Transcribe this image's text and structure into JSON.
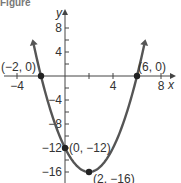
{
  "caption": "Figure",
  "chart_data": {
    "type": "line",
    "title": "",
    "xlabel": "x",
    "ylabel": "y",
    "xlim": [
      -5,
      9
    ],
    "ylim": [
      -17,
      12
    ],
    "x_ticks": [
      -4,
      -2,
      0,
      2,
      4,
      6,
      8
    ],
    "x_tick_labels": [
      {
        "value": -4,
        "label": "−4"
      },
      {
        "value": 4,
        "label": "4"
      },
      {
        "value": 8,
        "label": "8"
      }
    ],
    "y_ticks": [
      8,
      6,
      4,
      2,
      -2,
      -4,
      -6,
      -8,
      -10,
      -12,
      -14,
      -16
    ],
    "y_tick_labels": [
      {
        "value": 8,
        "label": "8"
      },
      {
        "value": 4,
        "label": "4"
      },
      {
        "value": -4,
        "label": "−4"
      },
      {
        "value": -8,
        "label": "−8"
      },
      {
        "value": -12,
        "label": "−12"
      },
      {
        "value": -16,
        "label": "−16"
      }
    ],
    "function": "y = x^2 - 4x - 12",
    "curve_x_range": [
      -2.6,
      6.6
    ],
    "grid": false,
    "points": [
      {
        "x": -2,
        "y": 0,
        "label": "(−2, 0)",
        "label_pos": "above-left"
      },
      {
        "x": 6,
        "y": 0,
        "label": "(6, 0)",
        "label_pos": "above-right"
      },
      {
        "x": 0,
        "y": -12,
        "label": "(0, −12)",
        "label_pos": "right"
      },
      {
        "x": 2,
        "y": -16,
        "label": "(2, −16)",
        "label_pos": "below-right"
      }
    ]
  }
}
